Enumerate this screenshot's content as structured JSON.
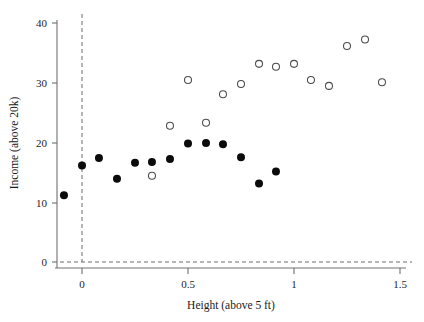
{
  "chart_data": {
    "type": "scatter",
    "title": "",
    "xlabel": "Height (above 5 ft)",
    "ylabel": "Income (above 20k)",
    "xlim": [
      -0.15,
      1.53
    ],
    "ylim": [
      -1.5,
      42
    ],
    "xticks": [
      0,
      0.5,
      1,
      1.5
    ],
    "xticklabels": [
      "0",
      "0.5",
      "1",
      "1.5"
    ],
    "yticks": [
      0,
      10,
      20,
      30,
      40
    ],
    "yticklabels": [
      "0",
      "10",
      "20",
      "30",
      "40"
    ],
    "grid": false,
    "legend": "none",
    "annotations": [
      {
        "name": "vertical-reference-line",
        "type": "vline",
        "x": 0,
        "style": "dashed"
      },
      {
        "name": "horizontal-reference-line",
        "type": "hline",
        "y": 0,
        "style": "dashed"
      }
    ],
    "series": [
      {
        "name": "filled",
        "marker": "filled-circle",
        "color": "#0b0b0b",
        "points": [
          {
            "x": -0.085,
            "y": 11.2
          },
          {
            "x": 0.0,
            "y": 16.2
          },
          {
            "x": 0.08,
            "y": 17.5
          },
          {
            "x": 0.165,
            "y": 14.0
          },
          {
            "x": 0.25,
            "y": 16.7
          },
          {
            "x": 0.33,
            "y": 16.8
          },
          {
            "x": 0.415,
            "y": 17.3
          },
          {
            "x": 0.5,
            "y": 19.9
          },
          {
            "x": 0.585,
            "y": 20.0
          },
          {
            "x": 0.665,
            "y": 19.8
          },
          {
            "x": 0.75,
            "y": 17.6
          },
          {
            "x": 0.835,
            "y": 13.2
          },
          {
            "x": 0.915,
            "y": 15.2
          }
        ]
      },
      {
        "name": "open",
        "marker": "open-circle",
        "color": "#4a4a4a",
        "points": [
          {
            "x": 0.33,
            "y": 14.5
          },
          {
            "x": 0.415,
            "y": 22.9
          },
          {
            "x": 0.5,
            "y": 30.6
          },
          {
            "x": 0.585,
            "y": 23.4
          },
          {
            "x": 0.665,
            "y": 28.2
          },
          {
            "x": 0.75,
            "y": 29.9
          },
          {
            "x": 0.835,
            "y": 33.3
          },
          {
            "x": 0.915,
            "y": 32.8
          },
          {
            "x": 1.0,
            "y": 33.3
          },
          {
            "x": 1.08,
            "y": 30.6
          },
          {
            "x": 1.165,
            "y": 29.6
          },
          {
            "x": 1.25,
            "y": 36.3
          },
          {
            "x": 1.335,
            "y": 37.4
          },
          {
            "x": 1.415,
            "y": 30.2
          }
        ]
      }
    ]
  },
  "figure": {
    "background": "#ffffff",
    "axis_color": "#707070",
    "reference_line_color": "#6d6d6d"
  }
}
